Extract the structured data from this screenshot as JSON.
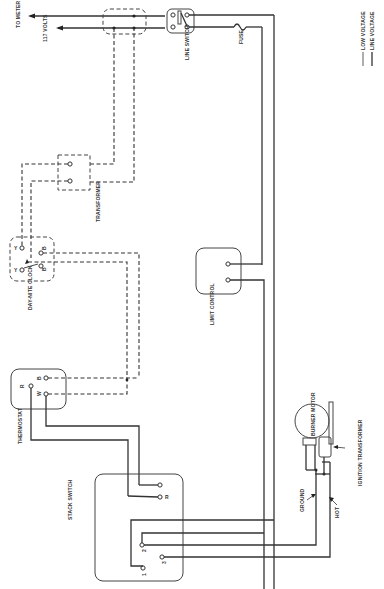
{
  "diagram": {
    "type": "wiring-schematic",
    "orientation": "rotated 90deg (labels read bottom-to-top)",
    "legend": {
      "low_voltage": "LOW VOLTAGE",
      "line_voltage": "LINE VOLTAGE"
    },
    "supply": {
      "to_meter": "TO METER",
      "volts": "117 VOLTS"
    },
    "components": {
      "line_switch": "LINE SWITCH",
      "fuse": "FUSE",
      "transformer": "TRANSFORMER",
      "day_nite_clock": "DAY-NITE CLOCK",
      "limit_control": "LIMIT CONTROL",
      "thermostat": "THERMOSTAT",
      "stack_switch": "STACK SWITCH",
      "burner_motor": "BURNER MOTOR",
      "ignition_transformer": "IGNITION TRANSFORMER",
      "ground": "GROUND",
      "hot": "HOT"
    },
    "terminals": {
      "clock_y1": "Y",
      "clock_y2": "Y",
      "clock_b1": "B",
      "clock_b2": "B",
      "thermostat_r": "R",
      "thermostat_b": "B",
      "thermostat_w": "W",
      "stack_r": "R",
      "stack_1": "1",
      "stack_2": "2",
      "stack_3": "3"
    }
  }
}
